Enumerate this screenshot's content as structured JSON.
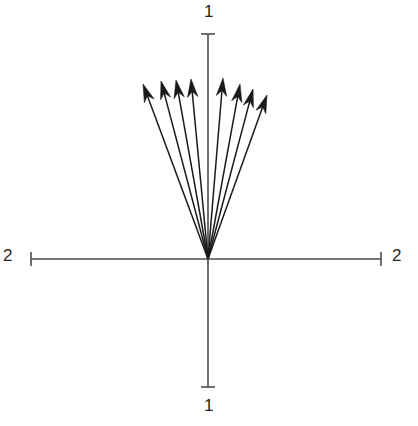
{
  "figure": {
    "type": "quiver-vector-plot",
    "background_color": "#ffffff",
    "line_color": "#1a1a1a",
    "axis_color": "#4d4d4d",
    "label_color": "#262626"
  },
  "axes": {
    "horizontal": {
      "label_left": "2",
      "label_right": "2",
      "x_start": 31,
      "x_end": 381,
      "y": 259,
      "tick_cap_half_height": 7
    },
    "vertical": {
      "label_top": "1",
      "label_bottom": "1",
      "y_start": 34,
      "y_end": 387,
      "x": 208,
      "tick_cap_half_width": 7
    },
    "origin": {
      "x": 208,
      "y": 259
    }
  },
  "chart_data": {
    "type": "scatter",
    "title": "",
    "xlabel": "2",
    "ylabel": "1",
    "grid": false,
    "legend": null,
    "xlim": [
      -2,
      2
    ],
    "ylim": [
      -1,
      1
    ],
    "xtick_labels": [
      "2",
      "2"
    ],
    "ytick_labels": [
      "1",
      "1"
    ],
    "origin_px": [
      208,
      259
    ],
    "arrow_count": 8,
    "arrows": [
      {
        "index": 1,
        "tail_px": [
          208,
          259
        ],
        "tip_px": [
          143,
          84
        ],
        "angle_deg": 110.4,
        "length_px": 186.7
      },
      {
        "index": 2,
        "tail_px": [
          208,
          259
        ],
        "tip_px": [
          161,
          81
        ],
        "angle_deg": 104.8,
        "length_px": 184.1
      },
      {
        "index": 3,
        "tail_px": [
          208,
          259
        ],
        "tip_px": [
          176,
          80
        ],
        "angle_deg": 100.2,
        "length_px": 181.9
      },
      {
        "index": 4,
        "tail_px": [
          208,
          259
        ],
        "tip_px": [
          191,
          79
        ],
        "angle_deg": 95.1,
        "length_px": 180.8
      },
      {
        "index": 5,
        "tail_px": [
          208,
          259
        ],
        "tip_px": [
          223,
          78
        ],
        "angle_deg": 85.3,
        "length_px": 181.6
      },
      {
        "index": 6,
        "tail_px": [
          208,
          259
        ],
        "tip_px": [
          240,
          84
        ],
        "angle_deg": 79.6,
        "length_px": 177.9
      },
      {
        "index": 7,
        "tail_px": [
          208,
          259
        ],
        "tip_px": [
          253,
          89
        ],
        "angle_deg": 75.2,
        "length_px": 175.9
      },
      {
        "index": 8,
        "tail_px": [
          208,
          259
        ],
        "tip_px": [
          267,
          95
        ],
        "angle_deg": 70.2,
        "length_px": 174.3
      }
    ]
  }
}
